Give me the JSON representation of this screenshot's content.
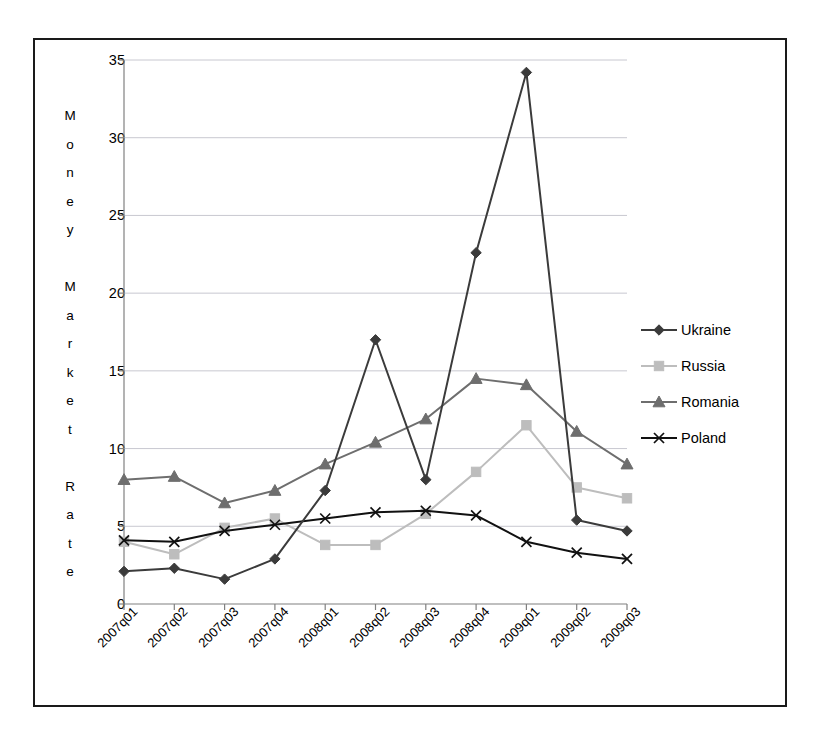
{
  "chart_data": {
    "type": "line",
    "title": "",
    "xlabel": "",
    "ylabel": "Money Market Rate",
    "ylabel_chars": [
      "M",
      "o",
      "n",
      "e",
      "y",
      "",
      "M",
      "a",
      "r",
      "k",
      "e",
      "t",
      "",
      "R",
      "a",
      "t",
      "e"
    ],
    "categories": [
      "2007q01",
      "2007q02",
      "2007q03",
      "2007q04",
      "2008q01",
      "2008q02",
      "2008q03",
      "2008q04",
      "2009q01",
      "2009q02",
      "2009q03"
    ],
    "ylim": [
      0,
      35
    ],
    "yticks": [
      0,
      5,
      10,
      15,
      20,
      25,
      30,
      35
    ],
    "grid": true,
    "grid_axis": "y",
    "legend_position": "right",
    "series": [
      {
        "name": "Ukraine",
        "marker": "diamond",
        "color": "#3b3b3b",
        "values": [
          2.1,
          2.3,
          1.6,
          2.9,
          7.3,
          17.0,
          8.0,
          22.6,
          34.2,
          5.4,
          4.7
        ]
      },
      {
        "name": "Russia",
        "marker": "square",
        "color": "#bdbdbd",
        "values": [
          4.0,
          3.2,
          4.9,
          5.5,
          3.8,
          3.8,
          5.8,
          8.5,
          11.5,
          7.5,
          6.8
        ]
      },
      {
        "name": "Romania",
        "marker": "triangle",
        "color": "#6e6e6e",
        "values": [
          8.0,
          8.2,
          6.5,
          7.3,
          9.0,
          10.4,
          11.9,
          14.5,
          14.1,
          11.1,
          9.0
        ]
      },
      {
        "name": "Poland",
        "marker": "x",
        "color": "#111111",
        "values": [
          4.1,
          4.0,
          4.7,
          5.1,
          5.5,
          5.9,
          6.0,
          5.7,
          4.0,
          3.3,
          2.9
        ]
      }
    ]
  },
  "colors": {
    "frame_border": "#1a1a1a",
    "axis_line": "#808080",
    "gridline": "#c8c8d0",
    "background": "#ffffff"
  }
}
